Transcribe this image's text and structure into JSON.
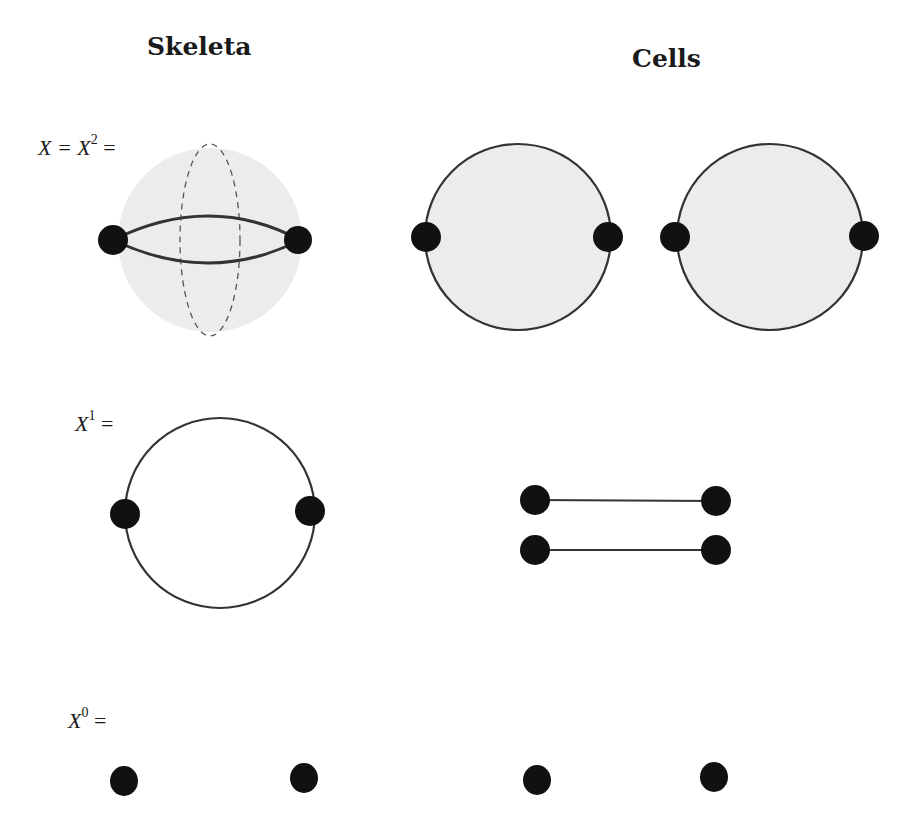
{
  "headings": {
    "skeleta": "Skeleta",
    "cells": "Cells"
  },
  "labels": {
    "x2": {
      "prefix": "X = X",
      "sup": "2",
      "suffix": " ="
    },
    "x1": {
      "prefix": "X",
      "sup": "1",
      "suffix": " ="
    },
    "x0": {
      "prefix": "X",
      "sup": "0",
      "suffix": " ="
    }
  },
  "colors": {
    "fill": "#ececec",
    "stroke": "#333333",
    "vertex": "#111111"
  },
  "rows": [
    {
      "name": "2-skeleton",
      "skeleton": "sphere with two vertices, two edges, two 2-cells (dashed equator)",
      "cells": "two 2-disks with boundary vertices"
    },
    {
      "name": "1-skeleton",
      "skeleton": "circle with two vertices",
      "cells": "two 1-cells (intervals)"
    },
    {
      "name": "0-skeleton",
      "skeleton": "two points",
      "cells": "two 0-cells"
    }
  ]
}
